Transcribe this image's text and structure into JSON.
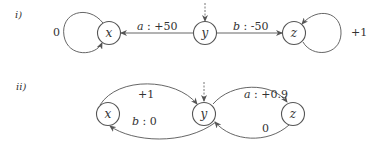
{
  "diagrams": [
    {
      "label": "i)",
      "nodes": [
        {
          "id": "x",
          "label": "x"
        },
        {
          "id": "y",
          "label": "y",
          "initial": true
        },
        {
          "id": "z",
          "label": "z"
        }
      ],
      "edges": [
        {
          "from": "y",
          "to": "x",
          "action": "a",
          "reward": "+50",
          "text": "a : +50"
        },
        {
          "from": "y",
          "to": "z",
          "action": "b",
          "reward": "-50",
          "text": "b : -50"
        },
        {
          "from": "x",
          "to": "x",
          "text": "0"
        },
        {
          "from": "z",
          "to": "z",
          "text": "+1"
        }
      ]
    },
    {
      "label": "ii)",
      "nodes": [
        {
          "id": "x",
          "label": "x"
        },
        {
          "id": "y",
          "label": "y",
          "initial": true
        },
        {
          "id": "z",
          "label": "z"
        }
      ],
      "edges": [
        {
          "from": "x",
          "to": "y",
          "text": "+1"
        },
        {
          "from": "y",
          "to": "x",
          "action": "b",
          "reward": "0",
          "text": "b : 0"
        },
        {
          "from": "y",
          "to": "z",
          "action": "a",
          "reward": "+0.9",
          "text": "a : +0.9"
        },
        {
          "from": "z",
          "to": "y",
          "text": "0"
        }
      ]
    }
  ],
  "d1": {
    "label": "i)",
    "x": "x",
    "y": "y",
    "z": "z",
    "e_yx_action": "a",
    "e_yx_reward": " : +50",
    "e_yz_action": "b",
    "e_yz_reward": " : -50",
    "loop_x": "0",
    "loop_z": "+1"
  },
  "d2": {
    "label": "ii)",
    "x": "x",
    "y": "y",
    "z": "z",
    "e_xy": "+1",
    "e_yx_action": "b",
    "e_yx_reward": " : 0",
    "e_yz_action": "a",
    "e_yz_reward": " : +0.9",
    "e_zy": "0"
  }
}
